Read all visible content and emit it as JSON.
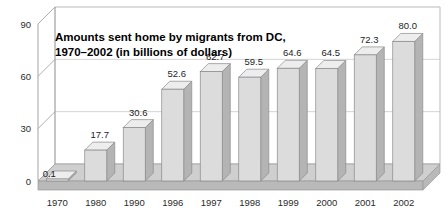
{
  "chart_data": {
    "type": "bar",
    "title": "Amounts sent home by migrants from DC, 1970–2002 (in billions of dollars)",
    "title_line1": "Amounts sent home by migrants from DC,",
    "title_line2": "1970–2002 (in billions of dollars)",
    "subtitle": "",
    "xlabel": "",
    "ylabel": "",
    "categories": [
      "1970",
      "1980",
      "1990",
      "1996",
      "1997",
      "1998",
      "1999",
      "2000",
      "2001",
      "2002"
    ],
    "values": [
      0.1,
      17.7,
      30.6,
      52.6,
      62.7,
      59.5,
      64.6,
      64.5,
      72.3,
      80.0
    ],
    "value_labels": [
      "0.1",
      "17.7",
      "30.6",
      "52.6",
      "62.7",
      "59.5",
      "64.6",
      "64.5",
      "72.3",
      "80.0"
    ],
    "ylim": [
      0,
      90
    ],
    "yticks": [
      0,
      30,
      60,
      90
    ],
    "ytick_labels": [
      "0",
      "30",
      "60",
      "90"
    ],
    "grid": true,
    "legend": false,
    "legend_position": "none",
    "style": "3d-column",
    "colors": {
      "bar_front": "#dcdcdc",
      "bar_side": "#b4b4b4",
      "bar_top": "#ededed",
      "bar_edge": "#8a8a8a",
      "floor": "#b9b9b9",
      "floor_top": "#cfcfcf",
      "grid": "#c8c8c8",
      "axis": "#9a9a9a",
      "text": "#1d1d1d",
      "background": "#ffffff"
    }
  },
  "figure": {
    "alt": "3D column chart of amounts sent home by migrants from DC, 1970 to 2002"
  }
}
